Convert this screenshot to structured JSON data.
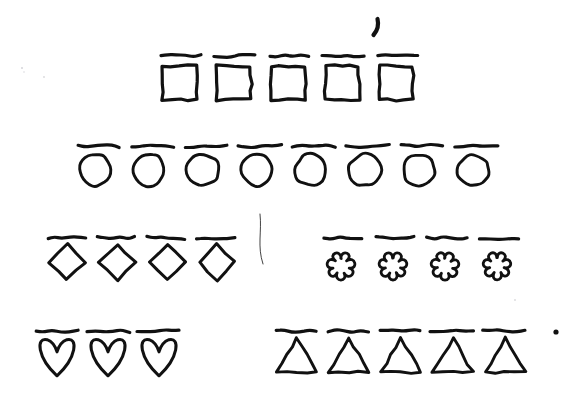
{
  "page": {
    "background_color": "#ffffff",
    "ink_color": "#111111",
    "width": 588,
    "height": 395
  },
  "rows": [
    {
      "id": "row-squares",
      "shape": "square",
      "shape_label": "square",
      "count": 5,
      "count_label": "5",
      "bar_above_each": true,
      "start_x": 163,
      "pitch": 54,
      "bar_y": 56,
      "bar_width": 40,
      "shape_top": 66,
      "shape_size": 34
    },
    {
      "id": "row-circles",
      "shape": "circle",
      "shape_label": "circle",
      "count": 8,
      "count_label": "8",
      "bar_above_each": true,
      "start_x": 79,
      "pitch": 54,
      "bar_y": 146,
      "bar_width": 42,
      "shape_top": 154,
      "shape_size": 32
    },
    {
      "id": "row-diamonds",
      "shape": "diamond",
      "shape_label": "diamond",
      "count": 4,
      "count_label": "4",
      "bar_above_each": true,
      "start_x": 49,
      "pitch": 50,
      "bar_y": 238,
      "bar_width": 38,
      "shape_top": 244,
      "shape_size": 36
    },
    {
      "id": "row-flowers",
      "shape": "flower",
      "shape_label": "flower",
      "count": 4,
      "count_label": "4",
      "bar_above_each": true,
      "start_x": 325,
      "pitch": 52,
      "bar_y": 238,
      "bar_width": 40,
      "shape_top": 248,
      "shape_size": 32
    },
    {
      "id": "row-hearts",
      "shape": "heart",
      "shape_label": "heart",
      "count": 3,
      "count_label": "3",
      "bar_above_each": true,
      "start_x": 38,
      "pitch": 51,
      "bar_y": 331,
      "bar_width": 42,
      "shape_top": 338,
      "shape_size": 38
    },
    {
      "id": "row-triangles",
      "shape": "triangle",
      "shape_label": "triangle",
      "count": 5,
      "count_label": "5",
      "bar_above_each": true,
      "start_x": 277,
      "pitch": 52,
      "bar_y": 331,
      "bar_width": 42,
      "shape_top": 338,
      "shape_size": 40
    }
  ],
  "marks": [
    {
      "id": "comma-mark",
      "label": "comma-like pen stroke",
      "x": 376,
      "y": 27
    },
    {
      "id": "dot-mark",
      "label": "small ink dot",
      "x": 556,
      "y": 332
    },
    {
      "id": "stray-line",
      "label": "faint stray pen line",
      "x": 258,
      "y": 240
    }
  ]
}
